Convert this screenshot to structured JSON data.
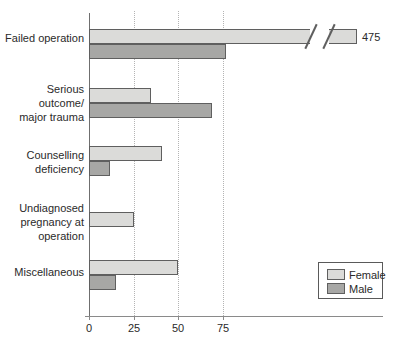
{
  "legend": {
    "items": [
      {
        "label": "Female",
        "color": "#dbdbd9"
      },
      {
        "label": "Male",
        "color": "#a7a7a5"
      }
    ]
  },
  "chart_data": {
    "type": "bar",
    "orientation": "horizontal",
    "title": "",
    "categories": [
      "Failed operation",
      "Serious outcome/ major trauma",
      "Counselling deficiency",
      "Undiagnosed pregnancy at operation",
      "Miscellaneous"
    ],
    "category_label_lines": [
      [
        "Failed operation"
      ],
      [
        "Serious outcome/",
        "major trauma"
      ],
      [
        "Counselling",
        "deficiency"
      ],
      [
        "Undiagnosed",
        "pregnancy at",
        "operation"
      ],
      [
        "Miscellaneous"
      ]
    ],
    "series": [
      {
        "name": "Female",
        "color": "#dbdbd9",
        "values": [
          475,
          35,
          41,
          25,
          50
        ]
      },
      {
        "name": "Male",
        "color": "#a7a7a5",
        "values": [
          77,
          69,
          12,
          0,
          15
        ]
      }
    ],
    "x_ticks": [
      0,
      25,
      50,
      75
    ],
    "xlim": [
      0,
      100
    ],
    "grid": "vertical dotted gridlines at 25, 50 and 75",
    "legend_position": "bottom-right",
    "axis_break": {
      "series": "Female",
      "category": "Failed operation",
      "value": 475,
      "annotation": "475"
    }
  }
}
